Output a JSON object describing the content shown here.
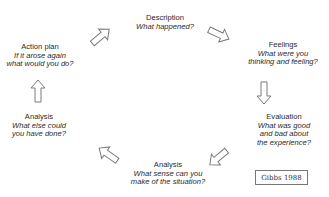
{
  "diagram": {
    "stages": [
      {
        "id": "description",
        "title": "Description",
        "question_lines": [
          "What happened?"
        ]
      },
      {
        "id": "feelings",
        "title": "Feelings",
        "question_lines": [
          "What were you",
          "thinking and feeling?"
        ]
      },
      {
        "id": "evaluation",
        "title": "Evaluation",
        "question_lines": [
          "What was good",
          "and bad about",
          "the experience?"
        ]
      },
      {
        "id": "analysis-sense",
        "title": "Analysis",
        "question_lines": [
          "What sense can you",
          "make of the situation?"
        ]
      },
      {
        "id": "analysis-else",
        "title": "Analysis",
        "question_lines": [
          "What else could",
          "you have done?"
        ]
      },
      {
        "id": "action-plan",
        "title": "Action plan",
        "question_lines": [
          "If it arose again",
          "what would you do?"
        ]
      }
    ],
    "reference": "Gibbs 1988",
    "colors": {
      "stroke": "#777777",
      "text": "#2a2a2a",
      "background": "#ffffff"
    }
  }
}
